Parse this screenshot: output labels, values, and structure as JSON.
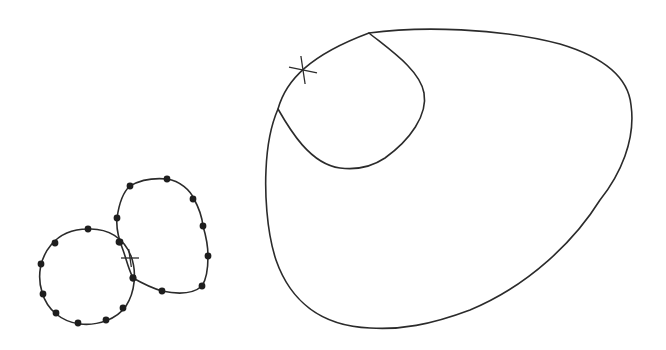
{
  "figure": {
    "width": 666,
    "height": 350,
    "stroke_color": "#2b2b2b",
    "dot_color": "#1e1e1e",
    "background": "#ffffff"
  },
  "left_diagram": {
    "circle": {
      "path": "M88,229 C108,228 124,238 131,256 C137,272 135,292 126,306 C117,319 98,326 80,324 C62,322 47,310 42,292 C37,276 40,258 51,245 C60,234 74,229 88,229 Z",
      "points": [
        [
          88,
          229
        ],
        [
          55,
          243
        ],
        [
          41,
          264
        ],
        [
          43,
          294
        ],
        [
          56,
          313
        ],
        [
          78,
          323
        ],
        [
          106,
          320
        ],
        [
          123,
          308
        ],
        [
          133,
          278
        ],
        [
          119,
          242
        ]
      ]
    },
    "blob": {
      "path": "M130,186 C142,179 156,178 167,179 C180,181 190,190 194,199 C199,208 202,217 203,226 C206,236 208,246 208,256 C208,268 206,280 202,286 C192,295 176,294 162,291 C152,288 140,282 133,278 C128,268 126,258 123,250 C119,240 116,228 117,218 C119,204 123,192 130,186 Z",
      "points": [
        [
          130,
          186
        ],
        [
          167,
          179
        ],
        [
          193,
          199
        ],
        [
          203,
          226
        ],
        [
          208,
          256
        ],
        [
          202,
          286
        ],
        [
          162,
          291
        ],
        [
          133,
          278
        ],
        [
          120,
          242
        ],
        [
          117,
          218
        ]
      ]
    },
    "cross": {
      "x": 130,
      "y": 258,
      "size": 9
    }
  },
  "right_diagram": {
    "outer": {
      "path": "M278,109 C286,80 310,55 369,33 C420,26 500,28 560,44 C600,56 628,75 631,105 C636,140 620,175 600,200 C575,240 530,285 470,310 C430,325 400,330 370,328 C320,326 290,300 276,260 C266,230 265,190 266,170 C267,145 271,125 278,109 Z"
    },
    "inner": {
      "path": "M369,33 C390,50 420,70 424,93 C428,115 410,140 385,158 C370,168 355,170 340,168 C310,164 290,130 278,109"
    },
    "cross": {
      "x": 303,
      "y": 70,
      "size": 14
    }
  }
}
